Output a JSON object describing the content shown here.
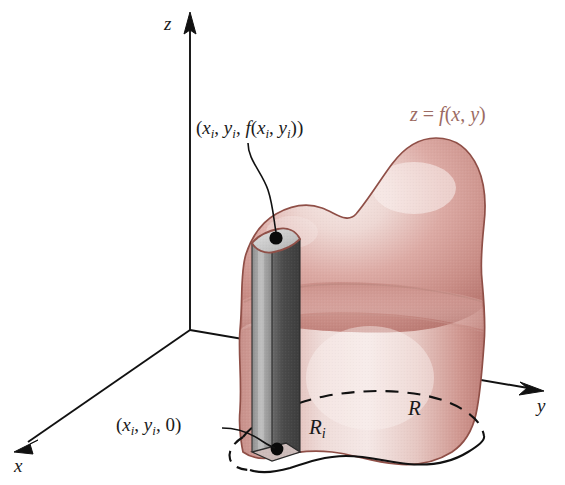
{
  "figure": {
    "background_color": "#ffffff"
  },
  "axes": {
    "x_label": "x",
    "y_label": "y",
    "z_label": "z",
    "origin": [
      190,
      330
    ],
    "arrow_color": "#111111"
  },
  "labels": {
    "top_point": {
      "open_paren": "(",
      "x_var": "x",
      "x_sub": "i",
      "comma1": ", ",
      "y_var": "y",
      "y_sub": "i",
      "comma2": ", ",
      "f_var": "f",
      "f_open": "(",
      "fx_var": "x",
      "fx_sub": "i",
      "comma3": ", ",
      "fy_var": "y",
      "fy_sub": "i",
      "close": "))",
      "text": "(xi, yi, f(xi, yi))"
    },
    "base_point": {
      "open_paren": "(",
      "x_var": "x",
      "x_sub": "i",
      "comma1": ", ",
      "y_var": "y",
      "y_sub": "i",
      "comma2": ", ",
      "zero": "0",
      "close": ")",
      "text": "(xi, yi, 0)"
    },
    "region": "R",
    "subregion_var": "R",
    "subregion_sub": "i",
    "surface_equation": {
      "z": "z",
      "equals": " = ",
      "f": "f",
      "open": "(",
      "x": "x",
      "comma": ", ",
      "y": "y",
      "close": ")",
      "text": "z = f(x, y)"
    }
  },
  "colors": {
    "surface_rim": "#b5706a",
    "surface_mid": "#d4a09c",
    "surface_light": "#ecd5d2",
    "surface_highlight": "#f7ecea",
    "surface_outline": "#8f4f47",
    "surface_label_text": "#9c6b63",
    "column_top_face": "#cfcfcf",
    "column_left_face": "#9a9a9a",
    "column_right_face": "#4f4f4f",
    "column_outline": "#8f4f47",
    "dot": "#0a0a0a",
    "axis": "#111111",
    "dashed_curve": "#111111"
  },
  "geometry": {
    "column_top_z": 232,
    "column_base_z": 452,
    "dot_top": [
      276,
      238
    ],
    "dot_base": [
      277,
      448
    ],
    "region_label_pos": [
      413,
      404
    ],
    "subregion_label_pos": [
      312,
      422
    ]
  }
}
